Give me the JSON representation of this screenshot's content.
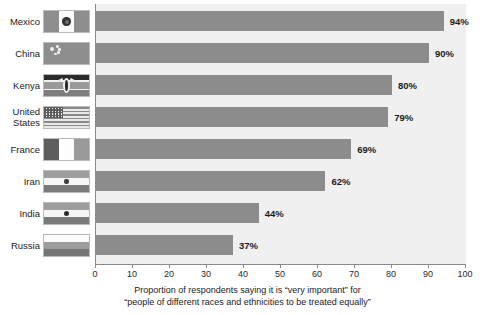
{
  "chart_data": {
    "type": "bar",
    "orientation": "horizontal",
    "title": "",
    "subtitle": "",
    "xlabel_line1": "Proportion of respondents saying it is “very important” for",
    "xlabel_line2": "“people of different races and ethnicities to be treated equally”",
    "ylabel": "",
    "xlim": [
      0,
      100
    ],
    "xticks": [
      0,
      10,
      20,
      30,
      40,
      50,
      60,
      70,
      80,
      90,
      100
    ],
    "xtick_labels": [
      "0",
      "10",
      "20",
      "30",
      "40",
      "50",
      "60",
      "70",
      "80",
      "90",
      "100"
    ],
    "grid": false,
    "legend": "none",
    "unit": "%",
    "categories": [
      "Mexico",
      "China",
      "Kenya",
      "United States",
      "France",
      "Iran",
      "India",
      "Russia"
    ],
    "values": [
      94,
      90,
      80,
      79,
      69,
      62,
      44,
      37
    ],
    "value_labels": [
      "94%",
      "90%",
      "80%",
      "79%",
      "69%",
      "62%",
      "44%",
      "37%"
    ],
    "bar_color": "#8c8c8c",
    "plot_background": "#f0f0f0",
    "axis_color": "#8a8a8a",
    "text_color": "#1b1b1b"
  },
  "rows": [
    {
      "label_line1": "Mexico",
      "label_line2": "",
      "value": 94,
      "value_label": "94%",
      "flag": "flag-mexico"
    },
    {
      "label_line1": "China",
      "label_line2": "",
      "value": 90,
      "value_label": "90%",
      "flag": "flag-china"
    },
    {
      "label_line1": "Kenya",
      "label_line2": "",
      "value": 80,
      "value_label": "80%",
      "flag": "flag-kenya"
    },
    {
      "label_line1": "United",
      "label_line2": "States",
      "value": 79,
      "value_label": "79%",
      "flag": "flag-united-states"
    },
    {
      "label_line1": "France",
      "label_line2": "",
      "value": 69,
      "value_label": "69%",
      "flag": "flag-france"
    },
    {
      "label_line1": "Iran",
      "label_line2": "",
      "value": 62,
      "value_label": "62%",
      "flag": "flag-iran"
    },
    {
      "label_line1": "India",
      "label_line2": "",
      "value": 44,
      "value_label": "44%",
      "flag": "flag-india"
    },
    {
      "label_line1": "Russia",
      "label_line2": "",
      "value": 37,
      "value_label": "37%",
      "flag": "flag-russia"
    }
  ]
}
